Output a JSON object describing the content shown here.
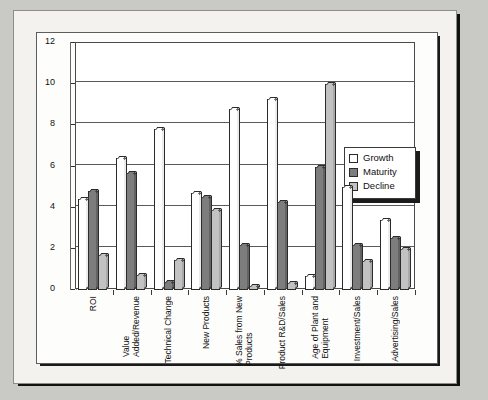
{
  "chart_data": {
    "type": "bar",
    "title": "",
    "xlabel": "",
    "ylabel": "",
    "ylim": [
      0,
      12
    ],
    "yticks": [
      0,
      2,
      4,
      6,
      8,
      10,
      12
    ],
    "ytick_labels": [
      "0",
      "2",
      "4",
      "6",
      "8",
      "10",
      "12"
    ],
    "grid": true,
    "legend_position": "right",
    "categories": [
      "ROI",
      "Value\nAdded/Revenue",
      "Technical Change",
      "New Products",
      "% Sales from New\nProducts",
      "Product R&D/Sales",
      "Age of Plant and\nEquipment",
      "Investment/Sales",
      "Advertising/Sales"
    ],
    "series": [
      {
        "name": "Growth",
        "color": "#ffffff",
        "values": [
          4.4,
          6.4,
          7.8,
          4.7,
          8.8,
          9.3,
          0.7,
          5.0,
          3.4
        ]
      },
      {
        "name": "Maturity",
        "color": "#7d7d7d",
        "values": [
          4.8,
          5.7,
          0.4,
          4.5,
          2.2,
          4.3,
          6.0,
          2.2,
          2.55
        ]
      },
      {
        "name": "Decline",
        "color": "#c2c2c2",
        "values": [
          1.7,
          0.75,
          1.45,
          3.9,
          0.2,
          0.35,
          10.0,
          1.4,
          2.0
        ]
      }
    ]
  },
  "legend": {
    "items": [
      {
        "label": "Growth"
      },
      {
        "label": "Maturity"
      },
      {
        "label": "Decline"
      }
    ]
  }
}
